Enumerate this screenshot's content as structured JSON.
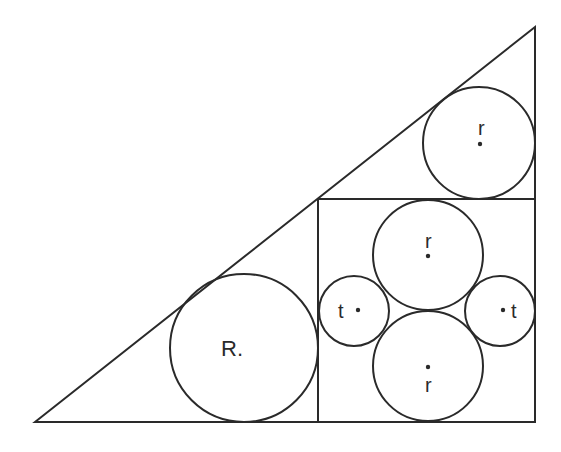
{
  "diagram": {
    "triangle": {
      "points": [
        [
          35,
          422
        ],
        [
          535,
          27
        ],
        [
          535,
          422
        ]
      ]
    },
    "square": {
      "x": 318,
      "y": 199,
      "width": 217,
      "height": 223
    },
    "circles": [
      {
        "id": "R",
        "label": "R.",
        "cx": 244,
        "cy": 348,
        "r": 74,
        "label_x": 233,
        "label_y": 356,
        "dot": false
      },
      {
        "id": "r_top_corner",
        "label": "r",
        "cx": 479,
        "cy": 143,
        "r": 56,
        "label_x": 483,
        "label_y": 134,
        "dot": true,
        "dot_x": 480,
        "dot_y": 143
      },
      {
        "id": "r_square_top",
        "label": "r",
        "cx": 428,
        "cy": 255,
        "r": 55,
        "label_x": 429,
        "label_y": 247,
        "dot": true,
        "dot_x": 428,
        "dot_y": 256
      },
      {
        "id": "r_square_bottom",
        "label": "r",
        "cx": 428,
        "cy": 366,
        "r": 55,
        "label_x": 429,
        "label_y": 391,
        "dot": true,
        "dot_x": 428,
        "dot_y": 367
      },
      {
        "id": "t_left",
        "label": "t",
        "cx": 354,
        "cy": 311,
        "r": 35,
        "label_x": 343,
        "label_y": 318,
        "dot": true,
        "dot_x": 357,
        "dot_y": 311
      },
      {
        "id": "t_right",
        "label": "t",
        "cx": 500,
        "cy": 311,
        "r": 35,
        "label_x": 516,
        "label_y": 318,
        "dot": true,
        "dot_x": 503,
        "dot_y": 311
      }
    ],
    "labels": {
      "R": "R.",
      "r": "r",
      "t": "t"
    },
    "colors": {
      "stroke": "#2a2a2a",
      "background": "#ffffff"
    }
  }
}
